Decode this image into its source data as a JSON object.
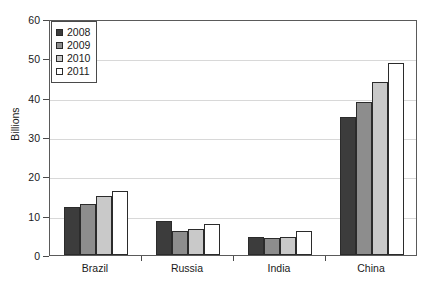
{
  "chart_data": {
    "type": "bar",
    "title": "",
    "subtitle": "",
    "xlabel": "",
    "ylabel": "Billions",
    "categories": [
      "Brazil",
      "Russia",
      "India",
      "China"
    ],
    "series": [
      {
        "name": "2008",
        "color": "#3c3c3c",
        "values": [
          12.2,
          8.6,
          4.5,
          35.2
        ]
      },
      {
        "name": "2009",
        "color": "#8d8d8d",
        "values": [
          13.0,
          6.1,
          4.3,
          39.0
        ]
      },
      {
        "name": "2010",
        "color": "#c9c9c9",
        "values": [
          14.9,
          6.6,
          4.5,
          44.0
        ]
      },
      {
        "name": "2011",
        "color": "#ffffff",
        "values": [
          16.2,
          8.0,
          6.0,
          48.8
        ]
      }
    ],
    "ylim": [
      0,
      60
    ],
    "yticks": [
      0,
      10,
      20,
      30,
      40,
      50,
      60
    ],
    "ytick_labels": [
      "0",
      "10",
      "20",
      "30",
      "40",
      "50",
      "60"
    ],
    "grid": true,
    "grid_axis": "y",
    "legend_position": "top-left",
    "legend_entries": [
      "2008",
      "2009",
      "2010",
      "2011"
    ],
    "bar_edge_color": "#2b2b2b",
    "axis_color": "#5a5a5a",
    "gridline_color": "#d8d8d8",
    "background_color": "#ffffff"
  }
}
